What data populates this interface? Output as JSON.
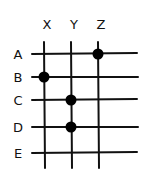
{
  "diagram": {
    "type": "grid-matrix",
    "columns": [
      {
        "label": "X",
        "x": 44
      },
      {
        "label": "Y",
        "x": 71
      },
      {
        "label": "Z",
        "x": 98
      }
    ],
    "rows": [
      {
        "label": "A",
        "y": 54
      },
      {
        "label": "B",
        "y": 77
      },
      {
        "label": "C",
        "y": 100
      },
      {
        "label": "D",
        "y": 127
      },
      {
        "label": "E",
        "y": 153
      }
    ],
    "dots": [
      {
        "row": "A",
        "col": "Z"
      },
      {
        "row": "B",
        "col": "X"
      },
      {
        "row": "C",
        "col": "Y"
      },
      {
        "row": "D",
        "col": "Y"
      }
    ],
    "line_color": "#111111",
    "dot_color": "#000000"
  }
}
